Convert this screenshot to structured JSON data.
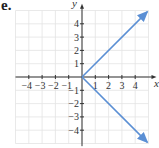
{
  "figure_label": "e.",
  "chart_data": {
    "type": "line",
    "title": "",
    "xlabel": "x",
    "ylabel": "y",
    "xlim": [
      -5,
      5
    ],
    "ylim": [
      -5,
      5
    ],
    "grid": true,
    "x_ticks": [
      -4,
      -3,
      -2,
      -1,
      1,
      2,
      3,
      4
    ],
    "y_ticks": [
      -4,
      -3,
      -2,
      -1,
      1,
      2,
      3,
      4
    ],
    "x_tick_labels": [
      "−4",
      "−3",
      "−2",
      "−1",
      "1",
      "2",
      "3",
      "4"
    ],
    "y_tick_labels": [
      "−4",
      "−3",
      "−2",
      "−1",
      "1",
      "2",
      "3",
      "4"
    ],
    "series": [
      {
        "name": "upper ray",
        "points": [
          [
            0,
            0
          ],
          [
            4.9,
            4.9
          ]
        ],
        "arrow_end": true,
        "color": "#5b8fd4"
      },
      {
        "name": "lower ray",
        "points": [
          [
            0,
            0
          ],
          [
            4.9,
            -4.9
          ]
        ],
        "arrow_end": true,
        "color": "#5b8fd4"
      }
    ],
    "equation_hint": "x = |y|"
  },
  "colors": {
    "line": "#5b8fd4",
    "grid": "#e3e3e3",
    "axis": "#333333"
  }
}
